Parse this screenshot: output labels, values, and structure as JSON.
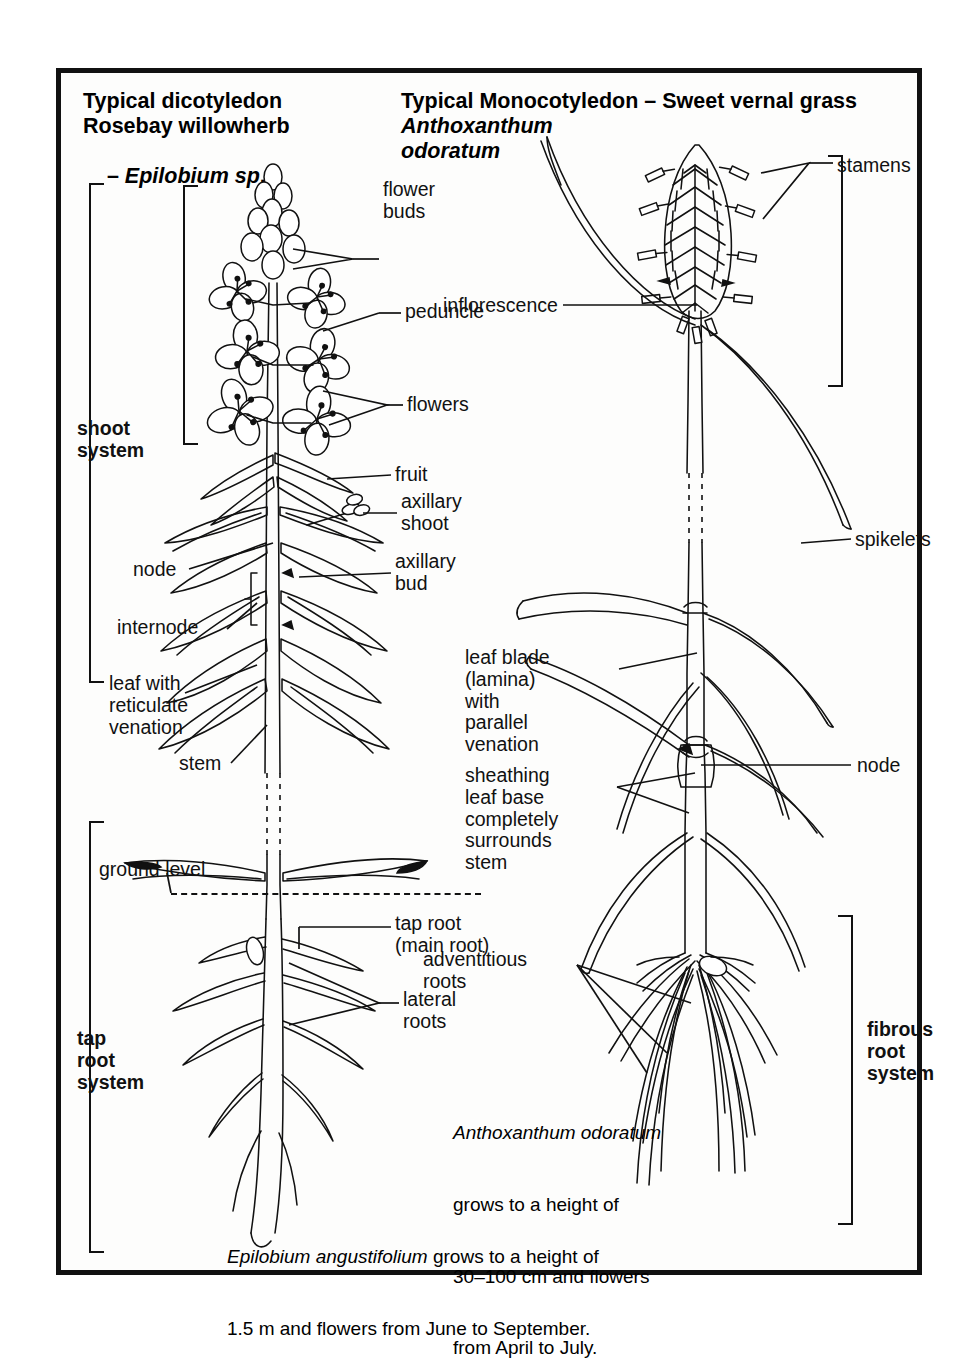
{
  "figure": {
    "kind": "botanical-comparison-diagram",
    "left_plant": {
      "title_line1": "Typical dicotyledon",
      "title_line2": "Rosebay willowherb",
      "title_line3_dash": "– ",
      "title_line3_italic": "Epilobium sp",
      "title_line3_tail": ".",
      "brackets": {
        "shoot_system": "shoot\nsystem",
        "inflorescence": "inflorescence",
        "tap_root_system": "tap\nroot\nsystem"
      },
      "labels": {
        "flower_buds": "flower\nbuds",
        "peduncle": "peduncle",
        "flowers": "flowers",
        "fruit": "fruit",
        "axillary_shoot": "axillary\nshoot",
        "axillary_bud": "axillary\nbud",
        "node": "node",
        "internode": "internode",
        "leaf_reticulate": "leaf with\nreticulate\nvenation",
        "stem": "stem",
        "ground_level": "ground level",
        "tap_root": "tap root\n(main root)",
        "lateral_roots": "lateral\nroots"
      },
      "caption_italic": "Epilobium angustifolium",
      "caption_rest": " grows to a height of",
      "caption_line2": "1.5 m and flowers from June to September."
    },
    "right_plant": {
      "title_line1": "Typical Monocotyledon – Sweet vernal grass",
      "title_line2_italic": "Anthoxanthum",
      "title_line3_italic": "odoratum",
      "brackets": {
        "fibrous_root_system": "fibrous\nroot\nsystem"
      },
      "labels": {
        "stamens": "stamens",
        "inflorescence": "inflorescence",
        "spikelets": "spikelets",
        "leaf_blade": "leaf blade\n(lamina)\nwith\nparallel\nvenation",
        "node": "node",
        "sheathing": "sheathing\nleaf base\ncompletely\nsurrounds\nstem",
        "adventitious_roots": "adventitious\nroots"
      },
      "caption_italic": "Anthoxanthum odoratum",
      "caption_line2": "grows to a height of",
      "caption_line3": "30–100 cm and flowers",
      "caption_line4": "from April to July."
    },
    "colors": {
      "ink": "#111111",
      "paper": "#fdfdfc",
      "frame": "#111111"
    }
  }
}
